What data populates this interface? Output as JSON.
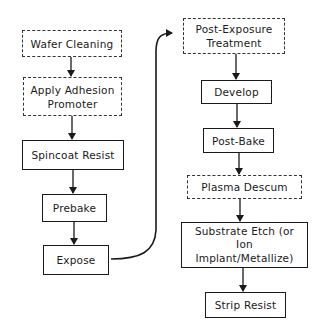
{
  "diagram": {
    "type": "flowchart",
    "title": "",
    "left_column": [
      {
        "id": "wafer-cleaning",
        "label": "Wafer Cleaning",
        "style": "dashed"
      },
      {
        "id": "apply-adhesion-promoter",
        "label": "Apply Adhesion\nPromoter",
        "style": "dashed"
      },
      {
        "id": "spincoat-resist",
        "label": "Spincoat Resist",
        "style": "solid"
      },
      {
        "id": "prebake",
        "label": "Prebake",
        "style": "solid"
      },
      {
        "id": "expose",
        "label": "Expose",
        "style": "solid"
      }
    ],
    "right_column": [
      {
        "id": "post-exposure-treatment",
        "label": "Post-Exposure\nTreatment",
        "style": "dashed"
      },
      {
        "id": "develop",
        "label": "Develop",
        "style": "solid"
      },
      {
        "id": "post-bake",
        "label": "Post-Bake",
        "style": "solid"
      },
      {
        "id": "plasma-descum",
        "label": "Plasma Descum",
        "style": "dashed"
      },
      {
        "id": "substrate-etch",
        "label": "Substrate Etch (or\nIon\nImplant/Metallize)",
        "style": "solid"
      },
      {
        "id": "strip-resist",
        "label": "Strip Resist",
        "style": "solid"
      }
    ],
    "edges": [
      [
        "wafer-cleaning",
        "apply-adhesion-promoter"
      ],
      [
        "apply-adhesion-promoter",
        "spincoat-resist"
      ],
      [
        "spincoat-resist",
        "prebake"
      ],
      [
        "prebake",
        "expose"
      ],
      [
        "expose",
        "post-exposure-treatment"
      ],
      [
        "post-exposure-treatment",
        "develop"
      ],
      [
        "develop",
        "post-bake"
      ],
      [
        "post-bake",
        "plasma-descum"
      ],
      [
        "plasma-descum",
        "substrate-etch"
      ],
      [
        "substrate-etch",
        "strip-resist"
      ]
    ],
    "legend": {
      "dashed": "optional step",
      "solid": "required step"
    }
  }
}
